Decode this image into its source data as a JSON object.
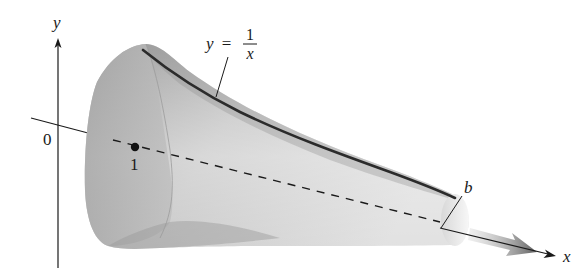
{
  "figure": {
    "type": "solid-of-revolution",
    "labels": {
      "y_axis": "y",
      "x_axis": "x",
      "origin": "0",
      "point_one": "1",
      "endpoint": "b",
      "curve_lhs": "y =",
      "curve_num": "1",
      "curve_den": "x"
    },
    "colors": {
      "surface_dark": "#8e8e8e",
      "surface_mid": "#b4b4b4",
      "surface_light": "#e6e6e6",
      "curve": "#2b2b2b",
      "axis": "#1a1a1a",
      "arrow_shade": "#6f6f6f"
    }
  }
}
